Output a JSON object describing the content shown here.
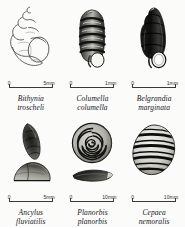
{
  "plate": {
    "kind": "mollusc-shell-identification-plate",
    "background_color": "#fbfbfa",
    "ink_color": "#1a1a1a",
    "columns": 3,
    "rows": 2
  },
  "specimens": [
    {
      "id": "bithynia-troscheli",
      "genus": "Bithynia",
      "species": "troscheli",
      "view": "apertural view of conical shell with large oval aperture",
      "rendering": "fine line drawing, unshaded",
      "scale": {
        "zero": "0",
        "unit": "5mm"
      }
    },
    {
      "id": "columella-columella",
      "genus": "Columella",
      "species": "columella",
      "view": "apertural view of cylindrical shell with rounded whorls",
      "rendering": "dark tonal wash with banded whorls",
      "scale": {
        "zero": "0",
        "unit": "1mm"
      }
    },
    {
      "id": "belgrandia-marginata",
      "genus": "Belgrandia",
      "species": "marginata",
      "view": "apertural view of tall conical shell with thickened aperture rim",
      "rendering": "very dark, near-silhouette",
      "scale": {
        "zero": "0",
        "unit": "1mm"
      }
    },
    {
      "id": "ancylus-fluviatilis",
      "genus": "Ancylus",
      "species": "fluviatilis",
      "view": "dorsal view above, lateral limpet profile below",
      "rendering": "mottled dark tone",
      "scale": {
        "zero": "0",
        "unit": "5mm"
      }
    },
    {
      "id": "planorbis-planorbis",
      "genus": "Planorbis",
      "species": "planorbis",
      "view": "flat spiral coil above, edge-on profile below",
      "rendering": "coiled whorls with dark sutures",
      "scale": {
        "zero": "0",
        "unit": "10mm"
      }
    },
    {
      "id": "cepaea-nemoralis",
      "genus": "Cepaea",
      "species": "nemoralis",
      "view": "globular banded shell",
      "rendering": "strong dark spiral bands",
      "scale": {
        "zero": "0",
        "unit": "10mm"
      }
    }
  ]
}
